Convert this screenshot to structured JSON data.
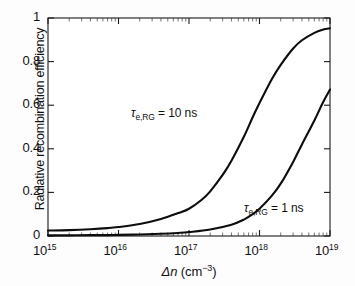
{
  "figure": {
    "background_color": "#fdfdfd",
    "line_color": "#0d0d0d",
    "axis_color": "#1a1a1a"
  },
  "chart_data": {
    "type": "line",
    "title": "",
    "xlabel": "Δn (cm⁻³)",
    "ylabel": "Radiative recombination efficiency",
    "xscale": "log",
    "yscale": "linear",
    "xlim": [
      1000000000000000.0,
      1e+19
    ],
    "ylim": [
      0,
      1
    ],
    "grid": false,
    "legend_position": "inline-annotations",
    "xtick_labels": [
      "10",
      "10",
      "10",
      "10",
      "10"
    ],
    "xtick_exponents": [
      "15",
      "16",
      "17",
      "18",
      "19"
    ],
    "xtick_values": [
      1000000000000000.0,
      1e+16,
      1e+17,
      1e+18,
      1e+19
    ],
    "ytick_labels": [
      "0",
      "0.2",
      "0.4",
      "0.6",
      "0.8",
      "1"
    ],
    "ytick_values": [
      0,
      0.2,
      0.4,
      0.6,
      0.8,
      1
    ],
    "minor_ticks": true,
    "series": [
      {
        "name": "τe,RG = 10 ns",
        "annotation": "τ",
        "annotation_sub": "e,RG",
        "annotation_tail": " = 10 ns",
        "x": [
          1000000000000000.0,
          2000000000000000.0,
          4000000000000000.0,
          7000000000000000.0,
          1e+16,
          2e+16,
          4e+16,
          7e+16,
          1e+17,
          1.5e+17,
          2e+17,
          3e+17,
          4e+17,
          6e+17,
          8e+17,
          1e+18,
          1.5e+18,
          2e+18,
          3e+18,
          4e+18,
          6e+18,
          8e+18,
          1e+19
        ],
        "values": [
          0.025,
          0.027,
          0.031,
          0.036,
          0.041,
          0.055,
          0.078,
          0.105,
          0.125,
          0.165,
          0.205,
          0.28,
          0.345,
          0.455,
          0.545,
          0.61,
          0.72,
          0.785,
          0.86,
          0.898,
          0.932,
          0.947,
          0.953
        ]
      },
      {
        "name": "τe,RG = 1 ns",
        "annotation": "τ",
        "annotation_sub": "e,RG",
        "annotation_tail": " = 1 ns",
        "x": [
          1000000000000000.0,
          2000000000000000.0,
          4000000000000000.0,
          7000000000000000.0,
          1e+16,
          2e+16,
          4e+16,
          7e+16,
          1e+17,
          2e+17,
          4e+17,
          6e+17,
          8e+17,
          1e+18,
          1.5e+18,
          2e+18,
          3e+18,
          4e+18,
          6e+18,
          8e+18,
          1e+19
        ],
        "values": [
          0.003,
          0.003,
          0.004,
          0.004,
          0.005,
          0.007,
          0.01,
          0.014,
          0.018,
          0.03,
          0.052,
          0.075,
          0.1,
          0.125,
          0.185,
          0.24,
          0.34,
          0.42,
          0.53,
          0.615,
          0.672
        ]
      }
    ]
  },
  "annotations": [
    {
      "id": "ann-10ns",
      "tau": "τ",
      "sub": "e,RG",
      "tail": " = 10 ns"
    },
    {
      "id": "ann-1ns",
      "tau": "τ",
      "sub": "e,RG",
      "tail": " = 1 ns"
    }
  ]
}
